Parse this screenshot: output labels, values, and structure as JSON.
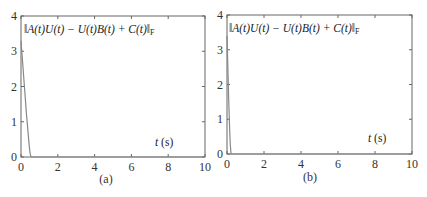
{
  "chart_data": [
    {
      "type": "line",
      "panel_label": "(a)",
      "annotation": "‖A(t)U(t) − U(t)B(t) + C(t)‖",
      "annotation_subscript": "F",
      "xlabel_italic": "t",
      "xlabel_unit": "(s)",
      "xlim": [
        0,
        10
      ],
      "ylim": [
        0,
        4
      ],
      "xticks": [
        0,
        2,
        4,
        6,
        8,
        10
      ],
      "yticks": [
        0,
        1,
        2,
        3,
        4
      ],
      "grid": false,
      "series": [
        {
          "name": "residual norm",
          "color": "#888888",
          "x": [
            0,
            0.05,
            0.1,
            0.15,
            0.2,
            0.25,
            0.3,
            0.35,
            0.4,
            0.45,
            0.5,
            0.55,
            10
          ],
          "y": [
            3.3,
            2.95,
            2.6,
            2.25,
            1.9,
            1.55,
            1.2,
            0.9,
            0.6,
            0.3,
            0.08,
            0,
            0
          ]
        }
      ]
    },
    {
      "type": "line",
      "panel_label": "(b)",
      "annotation": "‖A(t)U(t) − U(t)B(t) + C(t)‖",
      "annotation_subscript": "F",
      "xlabel_italic": "t",
      "xlabel_unit": "(s)",
      "xlim": [
        0,
        10
      ],
      "ylim": [
        0,
        4
      ],
      "xticks": [
        0,
        2,
        4,
        6,
        8,
        10
      ],
      "yticks": [
        0,
        1,
        2,
        3,
        4
      ],
      "grid": false,
      "series": [
        {
          "name": "residual norm",
          "color": "#888888",
          "x": [
            0,
            0.03,
            0.06,
            0.09,
            0.12,
            0.15,
            0.18,
            0.22,
            10
          ],
          "y": [
            3.4,
            2.8,
            2.2,
            1.6,
            1.1,
            0.6,
            0.25,
            0,
            0
          ]
        }
      ]
    }
  ]
}
